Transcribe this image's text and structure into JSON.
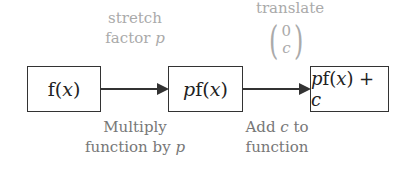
{
  "diagram": {
    "boxes": [
      {
        "id": "input",
        "text_main": "f(",
        "var": "x",
        "text_end": ")"
      },
      {
        "id": "stretched",
        "prefix": "p",
        "text_main": "f(",
        "var": "x",
        "text_end": ")"
      },
      {
        "id": "translated",
        "prefix": "p",
        "text_main": "f(",
        "var": "x",
        "text_end": ") + ",
        "suffix": "c"
      }
    ],
    "arrows": [
      {
        "from": "input",
        "to": "stretched",
        "above": {
          "line1": "stretch",
          "line2_text": "factor ",
          "line2_var": "p"
        },
        "below": {
          "line1": "Multiply",
          "line2_text": "function by ",
          "line2_var": "p"
        }
      },
      {
        "from": "stretched",
        "to": "translated",
        "above": {
          "line1": "translate",
          "vector": [
            "0",
            "c"
          ]
        },
        "below": {
          "line1_text": "Add ",
          "line1_var": "c",
          "line1_end": " to",
          "line2": "function"
        }
      }
    ],
    "colors": {
      "box_border": "#333333",
      "arrow": "#333333",
      "label_top": "#aaaaaa",
      "label_bottom": "#777777",
      "box_text": "#222222"
    }
  }
}
